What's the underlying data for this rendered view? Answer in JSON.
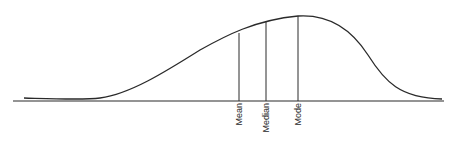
{
  "diagram": {
    "title": "",
    "colors": {
      "line": "#2a2a2a",
      "background": "#ffffff"
    },
    "labels": {
      "mean": "Mean",
      "median": "Median",
      "mode": "Mode"
    },
    "markers": [
      {
        "key": "mean",
        "label": "Mean",
        "x": 239,
        "curve_y": 33
      },
      {
        "key": "median",
        "label": "Median",
        "x": 266,
        "curve_y": 21
      },
      {
        "key": "mode",
        "label": "Mode",
        "x": 298,
        "curve_y": 16
      }
    ],
    "order_left_to_right": [
      "Mean",
      "Median",
      "Mode"
    ],
    "skew": "negative"
  }
}
